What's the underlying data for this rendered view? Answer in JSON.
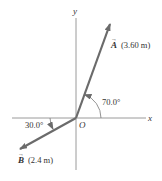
{
  "diagram": {
    "axes": {
      "x_label": "x",
      "y_label": "y",
      "origin_label": "O"
    },
    "vectors": [
      {
        "name": "A",
        "label": "A",
        "magnitude_label": "(3.60 m)",
        "angle_label": "70.0°",
        "angle_deg": 70.0,
        "reference": "from +x axis, counterclockwise"
      },
      {
        "name": "B",
        "label": "B",
        "magnitude_label": "(2.4 m)",
        "angle_label": "30.0°",
        "angle_deg": 30.0,
        "reference": "below -x axis"
      }
    ],
    "colors": {
      "vector": "#6b6b6b",
      "axis": "#9a9a9a",
      "text": "#333333"
    }
  }
}
